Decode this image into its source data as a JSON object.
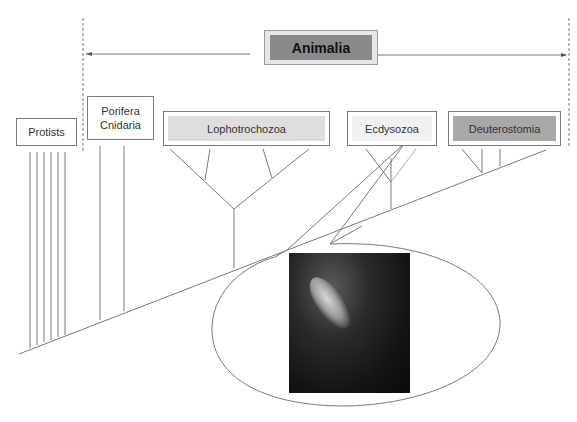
{
  "diagram": {
    "title": "Animalia",
    "groups": [
      {
        "id": "protists",
        "label": "Protists",
        "shade": "#ffffff"
      },
      {
        "id": "porifera",
        "label_line1": "Porifera",
        "label_line2": "Cnidaria",
        "shade": "#ffffff"
      },
      {
        "id": "lopho",
        "label": "Lophotrochozoa",
        "shade": "#dedede"
      },
      {
        "id": "ecdy",
        "label": "Ecdysozoa",
        "shade": "#f1f1f1"
      },
      {
        "id": "deutero",
        "label": "Deuterostomia",
        "shade": "#a8a8a8"
      }
    ],
    "callout": {
      "from": "Ecdysozoa",
      "image": "photo of a shrimp-like crustacean on dark background"
    },
    "colors": {
      "line": "#7a7a7a",
      "animalia_fill": "#8a8a8a"
    }
  }
}
